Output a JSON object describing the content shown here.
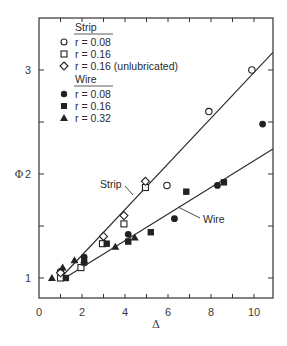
{
  "chart_data": {
    "type": "scatter",
    "title": "",
    "xlabel": "Δ",
    "ylabel": "Φ",
    "xlim": [
      0,
      10.9
    ],
    "ylim": [
      0.8,
      3.4
    ],
    "xticks": [
      0,
      2,
      4,
      6,
      8,
      10
    ],
    "yticks": [
      1,
      2,
      3
    ],
    "grid": false,
    "legend_position": "upper-left",
    "legend_groups": [
      {
        "heading": "Strip",
        "entries": [
          "r = 0.08",
          "r = 0.16",
          "r = 0.16 (unlubricated)"
        ]
      },
      {
        "heading": "Wire",
        "entries": [
          "r = 0.08",
          "r = 0.16",
          "r = 0.32"
        ]
      }
    ],
    "series": [
      {
        "name": "Strip r = 0.08",
        "marker": "open-circle",
        "x": [
          1.0,
          5.95,
          7.9,
          9.9
        ],
        "y": [
          1.06,
          1.89,
          2.6,
          3.0
        ]
      },
      {
        "name": "Strip r = 0.16",
        "marker": "open-square",
        "x": [
          1.0,
          1.95,
          2.95,
          3.95,
          4.95
        ],
        "y": [
          1.0,
          1.1,
          1.33,
          1.52,
          1.87
        ]
      },
      {
        "name": "Strip r = 0.16 (unlubricated)",
        "marker": "open-diamond",
        "x": [
          1.0,
          3.0,
          3.95,
          4.95
        ],
        "y": [
          1.05,
          1.4,
          1.6,
          1.93
        ]
      },
      {
        "name": "Wire r = 0.08",
        "marker": "filled-circle",
        "x": [
          2.1,
          4.15,
          6.3,
          8.3,
          10.4
        ],
        "y": [
          1.2,
          1.42,
          1.57,
          1.89,
          2.48
        ]
      },
      {
        "name": "Wire r = 0.16",
        "marker": "filled-square",
        "x": [
          1.25,
          2.1,
          3.15,
          4.15,
          5.2,
          6.85,
          8.6
        ],
        "y": [
          1.0,
          1.15,
          1.33,
          1.35,
          1.44,
          1.83,
          1.92
        ]
      },
      {
        "name": "Wire r = 0.32",
        "marker": "filled-triangle",
        "x": [
          0.6,
          1.1,
          1.65,
          2.1,
          3.55,
          4.45
        ],
        "y": [
          1.0,
          1.1,
          1.17,
          1.17,
          1.3,
          1.39
        ]
      }
    ],
    "fit_lines": [
      {
        "name": "Strip",
        "x": [
          1.0,
          10.88
        ],
        "y": [
          1.0,
          3.17
        ]
      },
      {
        "name": "Wire",
        "x": [
          1.2,
          10.88
        ],
        "y": [
          1.0,
          2.24
        ]
      }
    ],
    "annotations": [
      {
        "text": "Strip",
        "points_to": "Strip line near Δ≈4.4, Φ≈1.75"
      },
      {
        "text": "Wire",
        "points_to": "Wire line near Δ≈6.5, Φ≈1.68"
      }
    ]
  },
  "labels": {
    "xlabel": "Δ",
    "ylabel": "Φ",
    "xticks": [
      "0",
      "2",
      "4",
      "6",
      "8",
      "10"
    ],
    "yticks": [
      "1",
      "2",
      "3"
    ],
    "legend_strip": "Strip",
    "legend_wire": "Wire",
    "legend_s1": "r = 0.08",
    "legend_s2": "r = 0.16",
    "legend_s3": "r = 0.16 (unlubricated)",
    "legend_w1": "r = 0.08",
    "legend_w2": "r = 0.16",
    "legend_w3": "r = 0.32",
    "annot_strip": "Strip",
    "annot_wire": "Wire"
  },
  "colors": {
    "ink": "#2a2a2a",
    "background": "#ffffff"
  }
}
